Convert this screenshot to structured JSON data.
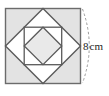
{
  "figure": {
    "canvas": {
      "width": 109,
      "height": 96
    },
    "colors": {
      "stroke": "#6b6b6b",
      "stroke_dark": "#5a5a5a",
      "shade": "#e3e3e3",
      "center_shade": "#e9e9e9",
      "background": "#ffffff",
      "dimension_arc": "#9a9a9a",
      "label_text": "#1d1d1d"
    },
    "outer_square": {
      "name": "outer-square",
      "x": 5.5,
      "y": 8.5,
      "size": 75.0,
      "side_label": "8 cm"
    },
    "outer_diamond": {
      "name": "outer-diamond",
      "points": "43,8.5 80.5,46 43,83.5 5.5,46"
    },
    "inner_square": {
      "name": "inner-square",
      "x": 24.2,
      "y": 27.2,
      "size": 37.5
    },
    "inner_diamond": {
      "name": "inner-diamond",
      "points": "43,27.2 61.7,46 43,64.7 24.2,46"
    },
    "shaded_corners": [
      {
        "name": "corner-top-left",
        "points": "5.5,8.5 43,8.5 5.5,46"
      },
      {
        "name": "corner-top-right",
        "points": "43,8.5 80.5,8.5 80.5,46"
      },
      {
        "name": "corner-bottom-right",
        "points": "80.5,46 80.5,83.5 43,83.5"
      },
      {
        "name": "corner-bottom-left",
        "points": "5.5,46 43,83.5 5.5,83.5"
      }
    ],
    "dimension": {
      "name": "side-dimension",
      "value": "8",
      "unit": "cm",
      "full_label": "8 cm",
      "arc_path": "M 82.5,9 Q 96,46 82.5,83"
    }
  }
}
